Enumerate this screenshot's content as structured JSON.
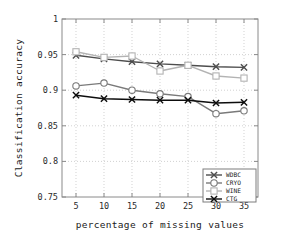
{
  "chart_data": {
    "type": "line",
    "title": "",
    "xlabel": "percentage of missing values",
    "ylabel": "Classification accuracy",
    "x": [
      5,
      10,
      15,
      20,
      25,
      30,
      35
    ],
    "xticklabels": [
      "5",
      "10",
      "15",
      "20",
      "25",
      "30",
      "35"
    ],
    "yticklabels": [
      "0.75",
      "0.8",
      "0.85",
      "0.9",
      "0.95",
      "1"
    ],
    "yticks": [
      0.75,
      0.8,
      0.85,
      0.9,
      0.95,
      1
    ],
    "xlim": [
      2.5,
      37.5
    ],
    "ylim": [
      0.75,
      1
    ],
    "grid": true,
    "legend_position": "lower right",
    "series": [
      {
        "name": "WDBC",
        "marker": "x-marker",
        "color": "#4d4d4d",
        "values": [
          0.949,
          0.944,
          0.94,
          0.937,
          0.935,
          0.933,
          0.932
        ]
      },
      {
        "name": "CRYO",
        "marker": "circle-marker",
        "color": "#7a7a7a",
        "values": [
          0.906,
          0.91,
          0.9,
          0.895,
          0.891,
          0.867,
          0.871
        ]
      },
      {
        "name": "WINE",
        "marker": "square-marker",
        "color": "#b3b3b3",
        "values": [
          0.954,
          0.946,
          0.948,
          0.927,
          0.935,
          0.92,
          0.917
        ]
      },
      {
        "name": "CTG",
        "marker": "x-marker",
        "color": "#0d0d0d",
        "values": [
          0.893,
          0.888,
          0.887,
          0.886,
          0.886,
          0.882,
          0.883
        ]
      }
    ]
  }
}
